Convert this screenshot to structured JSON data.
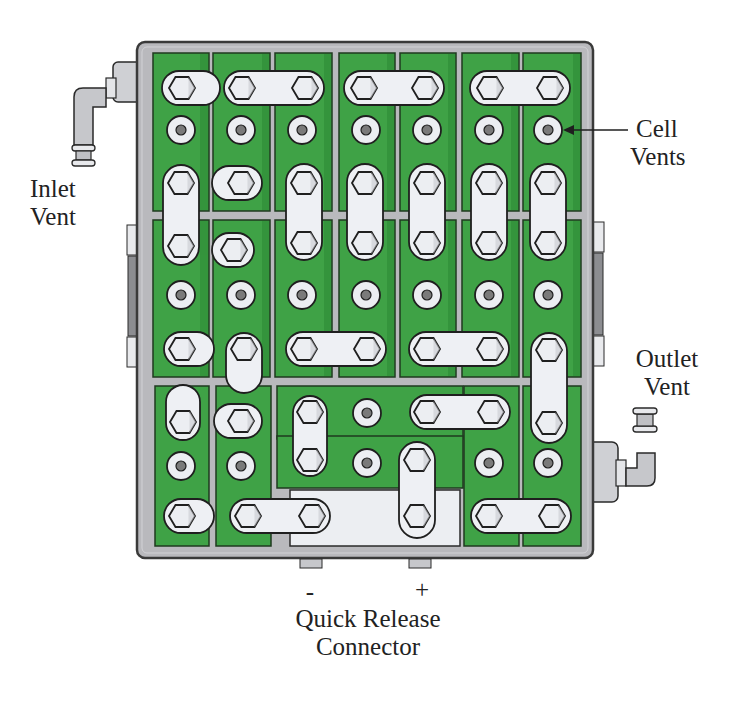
{
  "figure": {
    "colors": {
      "case": "#b9b9bd",
      "case_border": "#3a3a3a",
      "cell_green": "#3fa246",
      "cell_green_dark": "#2c8a35",
      "strap": "#eef0f4",
      "bolt": "#eceef2",
      "outline": "#1f1f1f",
      "vent_center": "#7a7a7a"
    }
  },
  "labels": {
    "inlet_vent": [
      "Inlet",
      "Vent"
    ],
    "cell_vents": [
      "Cell",
      "Vents"
    ],
    "outlet_vent": [
      "Outlet",
      "Vent"
    ],
    "minus": "-",
    "plus": "+",
    "connector": [
      "Quick Release",
      "Connector"
    ]
  }
}
